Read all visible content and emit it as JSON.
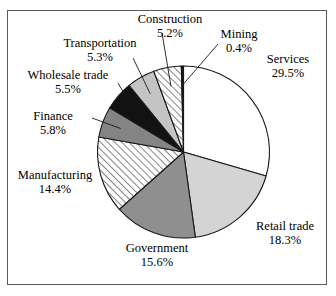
{
  "chart_data": {
    "type": "pie",
    "title": "",
    "subtitle": "",
    "xlabel": "",
    "ylabel": "",
    "legend_position": "none",
    "grid": false,
    "units": "percent",
    "start_angle_deg": 0,
    "direction": "clockwise",
    "categories": [
      "Services",
      "Retail trade",
      "Government",
      "Manufacturing",
      "Finance",
      "Wholesale trade",
      "Transportation",
      "Construction",
      "Mining"
    ],
    "values": [
      29.5,
      18.3,
      15.6,
      14.4,
      5.8,
      5.5,
      5.3,
      5.2,
      0.4
    ],
    "slices": [
      {
        "name": "Services",
        "label": "Services",
        "value": 29.5,
        "value_text": "29.5%",
        "fill": "#ffffff",
        "pattern": "solid"
      },
      {
        "name": "Retail trade",
        "label": "Retail trade",
        "value": 18.3,
        "value_text": "18.3%",
        "fill": "#d4d4d4",
        "pattern": "solid"
      },
      {
        "name": "Government",
        "label": "Government",
        "value": 15.6,
        "value_text": "15.6%",
        "fill": "#8f8f8f",
        "pattern": "solid"
      },
      {
        "name": "Manufacturing",
        "label": "Manufacturing",
        "value": 14.4,
        "value_text": "14.4%",
        "fill": "#ffffff",
        "pattern": "diagonal-hatch"
      },
      {
        "name": "Finance",
        "label": "Finance",
        "value": 5.8,
        "value_text": "5.8%",
        "fill": "#848484",
        "pattern": "solid"
      },
      {
        "name": "Wholesale trade",
        "label": "Wholesale trade",
        "value": 5.5,
        "value_text": "5.5%",
        "fill": "#121212",
        "pattern": "solid"
      },
      {
        "name": "Transportation",
        "label": "Transportation",
        "value": 5.3,
        "value_text": "5.3%",
        "fill": "#c4c4c4",
        "pattern": "solid"
      },
      {
        "name": "Construction",
        "label": "Construction",
        "value": 5.2,
        "value_text": "5.2%",
        "fill": "#ffffff",
        "pattern": "diagonal-hatch"
      },
      {
        "name": "Mining",
        "label": "Mining",
        "value": 0.4,
        "value_text": "0.4%",
        "fill": "#121212",
        "pattern": "solid"
      }
    ]
  },
  "labels": {
    "construction": {
      "name": "Construction",
      "value": "5.2%"
    },
    "mining": {
      "name": "Mining",
      "value": "0.4%"
    },
    "services": {
      "name": "Services",
      "value": "29.5%"
    },
    "transportation": {
      "name": "Transportation",
      "value": "5.3%"
    },
    "wholesale": {
      "name": "Wholesale trade",
      "value": "5.5%"
    },
    "finance": {
      "name": "Finance",
      "value": "5.8%"
    },
    "manufacturing": {
      "name": "Manufacturing",
      "value": "14.4%"
    },
    "government": {
      "name": "Government",
      "value": "15.6%"
    },
    "retail": {
      "name": "Retail trade",
      "value": "18.3%"
    }
  },
  "colors": {
    "outline": "#1a1a1a",
    "frame": "#5a5a5a",
    "background": "#ffffff",
    "text": "#000000",
    "leader_line": "#1a1a1a"
  }
}
